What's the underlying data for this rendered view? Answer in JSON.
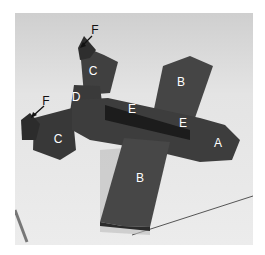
{
  "image": {
    "subject": "Model airplane made of dark foam/clay blocks with lettered parts",
    "background_color": "#e6e6e6",
    "model_color": "#3a3a3a"
  },
  "labels": [
    {
      "id": "A",
      "text": "A",
      "x": 218,
      "y": 143,
      "color": "white",
      "part": "nose"
    },
    {
      "id": "B1",
      "text": "B",
      "x": 181,
      "y": 82,
      "color": "white",
      "part": "upper wing"
    },
    {
      "id": "B2",
      "text": "B",
      "x": 140,
      "y": 178,
      "color": "white",
      "part": "lower wing"
    },
    {
      "id": "C1",
      "text": "C",
      "x": 93,
      "y": 71,
      "color": "white",
      "part": "upper tail stabilizer"
    },
    {
      "id": "C2",
      "text": "C",
      "x": 58,
      "y": 139,
      "color": "white",
      "part": "lower tail stabilizer"
    },
    {
      "id": "D",
      "text": "D",
      "x": 76,
      "y": 97,
      "color": "white",
      "part": "tail joint"
    },
    {
      "id": "E1",
      "text": "E",
      "x": 132,
      "y": 109,
      "color": "white",
      "part": "fuselage top"
    },
    {
      "id": "E2",
      "text": "E",
      "x": 183,
      "y": 123,
      "color": "white",
      "part": "fuselage top"
    },
    {
      "id": "F1",
      "text": "F",
      "x": 95,
      "y": 30,
      "color": "dark",
      "part": "upper fin"
    },
    {
      "id": "F2",
      "text": "F",
      "x": 46,
      "y": 101,
      "color": "dark",
      "part": "lower fin"
    }
  ]
}
